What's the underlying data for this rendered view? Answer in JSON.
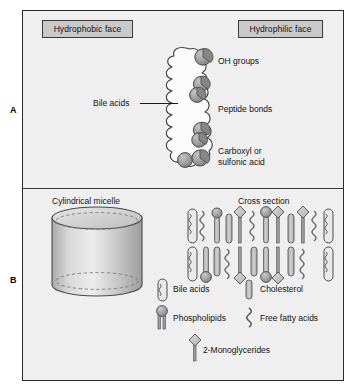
{
  "figure": {
    "panels": [
      {
        "letter": "A",
        "name": "bile-acid-structure"
      },
      {
        "letter": "B",
        "name": "micelle-structure"
      }
    ]
  },
  "panel_a": {
    "letter": "A",
    "face_left": "Hydrophobic face",
    "face_right": "Hydrophilic face",
    "molecule_label": "Bile acids",
    "annotations": [
      "OH groups",
      "Peptide bonds",
      "Carboxyl or",
      "sulfonic acid"
    ],
    "carboxyl_line1": "Carboxyl or",
    "carboxyl_line2": "sulfonic acid"
  },
  "panel_b": {
    "letter": "B",
    "micelle_title": "Cylindrical micelle",
    "cross_section_title": "Cross section",
    "legend": [
      {
        "label": "Bile acids",
        "icon": "bile-acid-icon"
      },
      {
        "label": "Cholesterol",
        "icon": "cholesterol-icon"
      },
      {
        "label": "Phospholipids",
        "icon": "phospholipid-icon"
      },
      {
        "label": "Free fatty acids",
        "icon": "free-fatty-acid-icon"
      },
      {
        "label": "2-Monoglycerides",
        "icon": "monoglyceride-icon"
      }
    ]
  },
  "colors": {
    "background": "#efefef",
    "page": "#ffffff",
    "border": "#2b2b2b",
    "box_fill": "#c9c9c9",
    "lobe_fill": "#9a9a9a",
    "text": "#111111"
  }
}
